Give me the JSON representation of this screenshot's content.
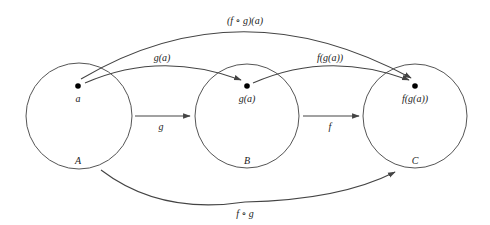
{
  "diagram": {
    "sets": [
      {
        "id": "A",
        "label": "A",
        "element_label": "a"
      },
      {
        "id": "B",
        "label": "B",
        "element_label": "g(a)"
      },
      {
        "id": "C",
        "label": "C",
        "element_label": "f(g(a))"
      }
    ],
    "arrows": {
      "g_label": "g",
      "f_label": "f",
      "composite_label": "f ∘ g",
      "point_g_label": "g(a)",
      "point_f_label": "f(g(a))",
      "point_composite_label": "(f ∘ g)(a)"
    },
    "colors": {
      "stroke": "#333333",
      "arrow": "#444444",
      "background": "#ffffff"
    }
  }
}
